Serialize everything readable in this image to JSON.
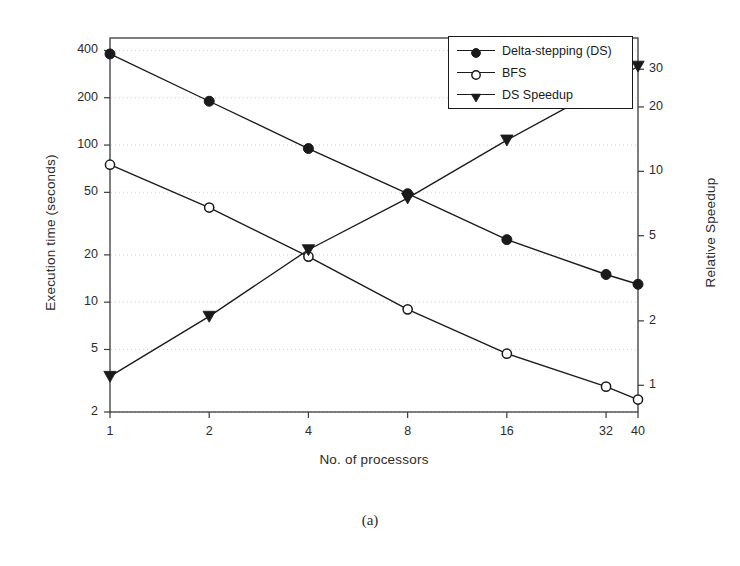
{
  "figure": {
    "caption": "(a)"
  },
  "chart_data": {
    "type": "line",
    "title": "",
    "xlabel": "No. of processors",
    "ylabel": "Execution time (seconds)",
    "ylabel_right": "Relative Speedup",
    "x": [
      1,
      2,
      4,
      8,
      16,
      32,
      40
    ],
    "xtick_labels": [
      "1",
      "2",
      "4",
      "8",
      "16",
      "32",
      "40"
    ],
    "xscale": "log2",
    "xlim": [
      1,
      40
    ],
    "yscale": "log",
    "ylim": [
      2,
      480
    ],
    "ytick_values": [
      400,
      200,
      100,
      50,
      20,
      10,
      5,
      2
    ],
    "ytick_labels": [
      "400",
      "200",
      "100",
      "50",
      "20",
      "10",
      "5",
      "2"
    ],
    "y2scale": "log",
    "y2lim": [
      0.75,
      42
    ],
    "y2tick_values": [
      30,
      20,
      10,
      5,
      2,
      1
    ],
    "y2tick_labels": [
      "30",
      "20",
      "10",
      "5",
      "2",
      "1"
    ],
    "grid": true,
    "grid_style": "dotted-horizontal",
    "legend_position": "top-right",
    "series": [
      {
        "name": "Delta-stepping (DS)",
        "axis": "left",
        "marker": "filled-circle",
        "values": [
          380,
          190,
          95,
          49,
          25,
          15,
          13
        ]
      },
      {
        "name": "BFS",
        "axis": "left",
        "marker": "open-circle",
        "values": [
          75,
          40,
          19.5,
          9.0,
          4.7,
          2.9,
          2.4
        ]
      },
      {
        "name": "DS Speedup",
        "axis": "right",
        "marker": "filled-triangle-down",
        "values": [
          1.1,
          2.1,
          4.3,
          7.5,
          14,
          25,
          31
        ]
      }
    ]
  },
  "colors": {
    "line": "#1a1a1a",
    "frame": "#3a3a3a",
    "grid": "#c9c9c9",
    "text": "#2b2b2b",
    "background": "#ffffff"
  }
}
